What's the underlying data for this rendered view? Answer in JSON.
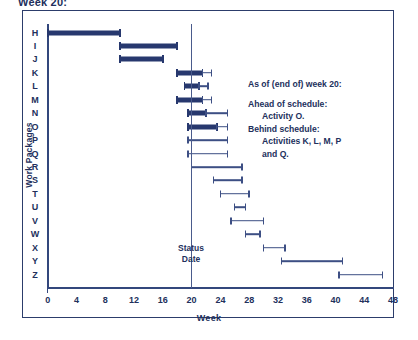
{
  "clipped_title": "Week 20:",
  "axes": {
    "x_title": "Week",
    "y_title": "Work Packages",
    "x_labels": [
      "0",
      "4",
      "8",
      "12",
      "16",
      "20",
      "24",
      "28",
      "32",
      "36",
      "40",
      "44",
      "48"
    ],
    "x_min": 0,
    "x_max": 48,
    "x_tick_step": 2,
    "x_label_step": 4
  },
  "status": {
    "week": 20,
    "line1": "Status",
    "line2": "Date"
  },
  "note": {
    "heading": "As of (end of) week 20:",
    "ahead_label": "Ahead of schedule:",
    "ahead_value": "Activity O.",
    "behind_label": "Behind schedule:",
    "behind_value": "Activities K, L, M, P",
    "behind_value2": "and Q."
  },
  "colors": {
    "bar_actual": "#27386e",
    "bar_planned": "#3d4f84",
    "axis": "#33477c",
    "text": "#22305c",
    "frame": "#2c3d6b",
    "background": "#ffffff"
  },
  "chart_data": {
    "type": "bar",
    "title": "Week 20:",
    "xlabel": "Week",
    "ylabel": "Work Packages",
    "xlim": [
      0,
      48
    ],
    "grid": false,
    "legend": "none",
    "status_date_week": 20,
    "categories": [
      "H",
      "I",
      "J",
      "K",
      "L",
      "M",
      "N",
      "O",
      "P",
      "Q",
      "R",
      "S",
      "T",
      "U",
      "V",
      "W",
      "X",
      "Y",
      "Z"
    ],
    "series": [
      {
        "name": "Actual (completed)",
        "style": "thick",
        "bars": [
          {
            "category": "H",
            "start": 0,
            "end": 10
          },
          {
            "category": "I",
            "start": 10,
            "end": 18
          },
          {
            "category": "J",
            "start": 10,
            "end": 16
          },
          {
            "category": "K",
            "start": 18,
            "end": 21.5
          },
          {
            "category": "L",
            "start": 19,
            "end": 21
          },
          {
            "category": "M",
            "start": 18,
            "end": 21.5
          },
          {
            "category": "N",
            "start": 19.5,
            "end": 22
          },
          {
            "category": "O",
            "start": 19.5,
            "end": 23.5
          }
        ]
      },
      {
        "name": "Planned (remaining)",
        "style": "thin",
        "bars": [
          {
            "category": "K",
            "start": 21.5,
            "end": 22.8
          },
          {
            "category": "L",
            "start": 21,
            "end": 22.3
          },
          {
            "category": "M",
            "start": 21.5,
            "end": 22.8
          },
          {
            "category": "N",
            "start": 22,
            "end": 25
          },
          {
            "category": "O",
            "start": 23.5,
            "end": 25
          },
          {
            "category": "P",
            "start": 19.5,
            "end": 25
          },
          {
            "category": "Q",
            "start": 19.5,
            "end": 25
          },
          {
            "category": "R",
            "start": 20,
            "end": 27
          },
          {
            "category": "S",
            "start": 23,
            "end": 27
          },
          {
            "category": "T",
            "start": 24,
            "end": 28
          },
          {
            "category": "U",
            "start": 26,
            "end": 27.5
          },
          {
            "category": "V",
            "start": 25.5,
            "end": 30
          },
          {
            "category": "W",
            "start": 27.5,
            "end": 29.5
          },
          {
            "category": "X",
            "start": 30,
            "end": 33
          },
          {
            "category": "Y",
            "start": 32.5,
            "end": 41
          },
          {
            "category": "Z",
            "start": 40.5,
            "end": 46.5
          }
        ]
      }
    ]
  }
}
